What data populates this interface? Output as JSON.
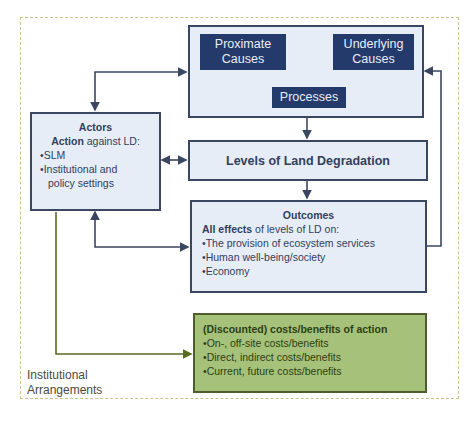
{
  "diagram": {
    "frame_label": [
      "Institutional",
      "Arrangements"
    ],
    "causes_group": {
      "proximate": [
        "Proximate",
        "Causes"
      ],
      "underlying": [
        "Underlying",
        "Causes"
      ],
      "processes": "Processes"
    },
    "actors": {
      "title": "Actors",
      "subtitle_bold": "Action",
      "subtitle_rest": " against LD:",
      "items": [
        "SLM",
        "Institutional and",
        "policy settings"
      ]
    },
    "levels": {
      "title": "Levels of Land Degradation"
    },
    "outcomes": {
      "title": "Outcomes",
      "subtitle_bold": "All effects",
      "subtitle_rest": " of levels of LD on:",
      "items": [
        "The provision of ecosystem services",
        "Human well-being/society",
        "Economy"
      ]
    },
    "costs": {
      "title": "(Discounted) costs/benefits of action",
      "items": [
        "On-, off-site costs/benefits",
        "Direct, indirect costs/benefits",
        "Current, future costs/benefits"
      ]
    },
    "colors": {
      "navy": "#243a6b",
      "light_box": "#e6edf6",
      "border": "#3b4760",
      "green": "#a5c17a",
      "green_line": "#5a6a1e",
      "dashed_frame": "#c8c28f"
    }
  }
}
